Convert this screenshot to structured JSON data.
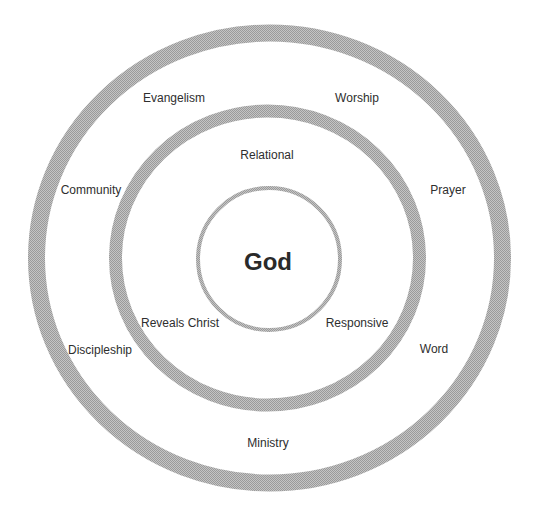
{
  "diagram": {
    "type": "concentric-circles",
    "colors": {
      "ring": "#a9a9a9",
      "ring_light": "#d0d0d0",
      "text": "#2e2e2e",
      "background": "#ffffff"
    },
    "center": {
      "label": "God"
    },
    "inner_ring": {
      "labels": [
        {
          "text": "Relational",
          "x": 267,
          "y": 155
        },
        {
          "text": "Reveals Christ",
          "x": 180,
          "y": 323
        },
        {
          "text": "Responsive",
          "x": 357,
          "y": 323
        }
      ]
    },
    "outer_ring": {
      "labels": [
        {
          "text": "Evangelism",
          "x": 174,
          "y": 98
        },
        {
          "text": "Worship",
          "x": 357,
          "y": 98
        },
        {
          "text": "Community",
          "x": 91,
          "y": 190
        },
        {
          "text": "Prayer",
          "x": 448,
          "y": 190
        },
        {
          "text": "Discipleship",
          "x": 100,
          "y": 350
        },
        {
          "text": "Word",
          "x": 434,
          "y": 349
        },
        {
          "text": "Ministry",
          "x": 268,
          "y": 443
        }
      ]
    }
  }
}
